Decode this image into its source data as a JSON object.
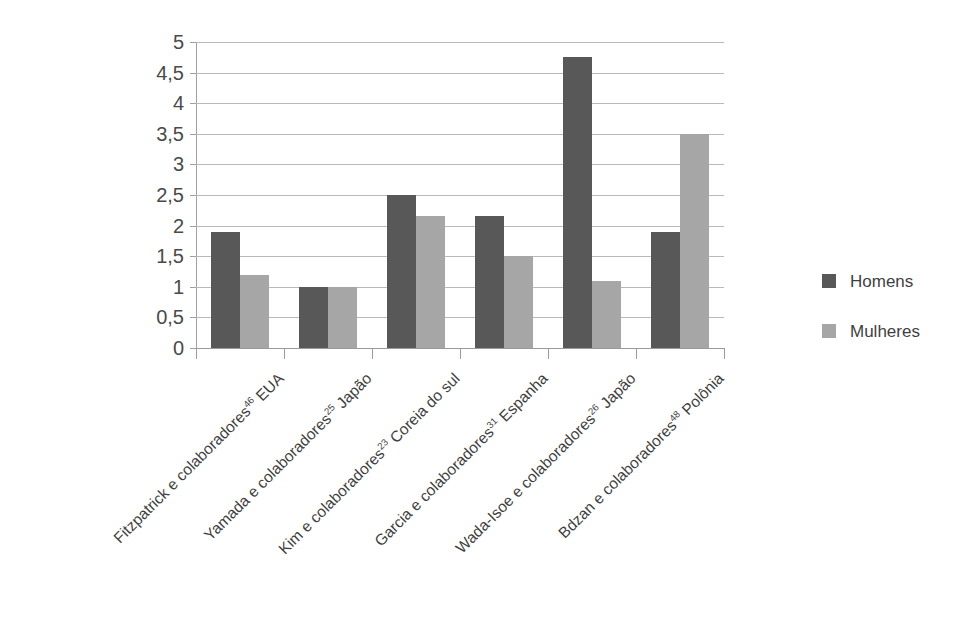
{
  "chart_data": {
    "type": "bar",
    "title": "",
    "subtitle": "",
    "xlabel": "",
    "ylabel": "",
    "ylim": [
      0,
      5
    ],
    "ytick_step": 0.5,
    "ytick_labels": [
      "5",
      "4,5",
      "4",
      "3,5",
      "3",
      "2,5",
      "2",
      "1,5",
      "1",
      "0,5",
      "0"
    ],
    "ytick_values": [
      5,
      4.5,
      4,
      3.5,
      3,
      2.5,
      2,
      1.5,
      1,
      0.5,
      0
    ],
    "grid": true,
    "grid_axis": "y",
    "legend_position": "right",
    "decimal_separator": ",",
    "categories": [
      "Fitzpatrick e colaboradores46 EUA",
      "Yamada e colaboradores25 Japão",
      "Kim e colaboradores23 Coreia do sul",
      "Garcia e colaboradores31 Espanha",
      "Wada-Isoe e colaboradores26 Japão",
      "Bdzan e colaboradores48 Polônia"
    ],
    "categories_parts": [
      {
        "name": "Fitzpatrick e colaboradores",
        "ref": "46",
        "tail": " EUA"
      },
      {
        "name": "Yamada e colaboradores",
        "ref": "25",
        "tail": " Japão"
      },
      {
        "name": "Kim e colaboradores",
        "ref": "23",
        "tail": " Coreia do sul"
      },
      {
        "name": "Garcia e colaboradores",
        "ref": "31",
        "tail": " Espanha"
      },
      {
        "name": "Wada-Isoe e colaboradores",
        "ref": "26",
        "tail": " Japão"
      },
      {
        "name": "Bdzan e colaboradores",
        "ref": "48",
        "tail": " Polônia"
      }
    ],
    "series": [
      {
        "name": "Homens",
        "color": "#585858",
        "values": [
          1.9,
          1.0,
          2.5,
          2.15,
          4.75,
          1.9
        ]
      },
      {
        "name": "Mulheres",
        "color": "#a6a6a6",
        "values": [
          1.2,
          1.0,
          2.15,
          1.5,
          1.1,
          3.5
        ]
      }
    ]
  },
  "legend": {
    "entries": [
      {
        "label": "Homens",
        "color": "#585858"
      },
      {
        "label": "Mulheres",
        "color": "#a6a6a6"
      }
    ]
  },
  "colors": {
    "homens": "#585858",
    "mulheres": "#a6a6a6",
    "gridline": "#b9b9b9",
    "axis": "#9a9a9a",
    "text": "#3f3f3f",
    "background": "#ffffff"
  }
}
